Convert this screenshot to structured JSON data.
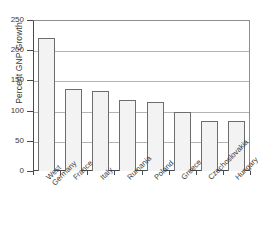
{
  "chart_data": {
    "type": "bar",
    "title": "",
    "xlabel": "",
    "ylabel": "Percent GNP Growth",
    "categories": [
      "West\nGermany",
      "France",
      "Italy",
      "Rumania",
      "Poland",
      "Greece",
      "Czechoslovakia",
      "Hungary"
    ],
    "values": [
      220,
      135,
      132,
      118,
      114,
      97,
      83,
      82
    ],
    "ylim": [
      0,
      250
    ],
    "ytick_labels": [
      "0",
      "50",
      "100",
      "150",
      "200",
      "250"
    ],
    "ytick_values": [
      0,
      50,
      100,
      150,
      200,
      250
    ],
    "grid": "horizontal",
    "legend": "none",
    "bar_fill_color": "#f3f3f3",
    "bar_edge_color": "#6d6d6d",
    "axis_color": "#4a4a4a",
    "grid_color": "#b4b4b4",
    "background_color": "#ffffff"
  }
}
